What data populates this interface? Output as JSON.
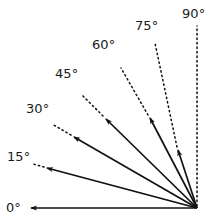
{
  "figure": {
    "background_color": "#ffffff",
    "line_color": "#111111",
    "label_color": "#1a1a1a",
    "vertex": {
      "x": 197,
      "y": 208
    },
    "degree_symbol": "°"
  },
  "rays": [
    {
      "id": "ray-0",
      "angle_deg": 0,
      "label": "0°",
      "label_x": 6,
      "label_y": 201,
      "solid_end": {
        "x": 31,
        "y": 208
      },
      "dotted_start": {
        "x": 31,
        "y": 208
      },
      "dotted_end": {
        "x": 31,
        "y": 208
      },
      "has_arrow": true,
      "fully_dotted": false
    },
    {
      "id": "ray-15",
      "angle_deg": 15,
      "label": "15°",
      "label_x": 7,
      "label_y": 150,
      "solid_end": {
        "x": 47,
        "y": 168
      },
      "dotted_start": {
        "x": 44,
        "y": 167
      },
      "dotted_end": {
        "x": 33,
        "y": 164
      },
      "has_arrow": true,
      "fully_dotted": false
    },
    {
      "id": "ray-30",
      "angle_deg": 30,
      "label": "30°",
      "label_x": 26,
      "label_y": 102,
      "solid_end": {
        "x": 74,
        "y": 137
      },
      "dotted_start": {
        "x": 71,
        "y": 135
      },
      "dotted_end": {
        "x": 52,
        "y": 124
      },
      "has_arrow": true,
      "fully_dotted": false
    },
    {
      "id": "ray-45",
      "angle_deg": 45,
      "label": "45°",
      "label_x": 55,
      "label_y": 67,
      "solid_end": {
        "x": 106,
        "y": 119
      },
      "dotted_start": {
        "x": 103,
        "y": 116
      },
      "dotted_end": {
        "x": 82,
        "y": 95
      },
      "has_arrow": true,
      "fully_dotted": false
    },
    {
      "id": "ray-60",
      "angle_deg": 60,
      "label": "60°",
      "label_x": 92,
      "label_y": 38,
      "solid_end": {
        "x": 150,
        "y": 118
      },
      "dotted_start": {
        "x": 148,
        "y": 115
      },
      "dotted_end": {
        "x": 121,
        "y": 68
      },
      "has_arrow": true,
      "fully_dotted": false
    },
    {
      "id": "ray-75",
      "angle_deg": 75,
      "label": "75°",
      "label_x": 135,
      "label_y": 19,
      "solid_end": {
        "x": 178,
        "y": 150
      },
      "dotted_start": {
        "x": 177,
        "y": 147
      },
      "dotted_end": {
        "x": 155,
        "y": 43
      },
      "has_arrow": true,
      "fully_dotted": false
    },
    {
      "id": "ray-90",
      "angle_deg": 90,
      "label": "90°",
      "label_x": 182,
      "label_y": 7,
      "solid_end": {
        "x": 197,
        "y": 208
      },
      "dotted_start": {
        "x": 197,
        "y": 206
      },
      "dotted_end": {
        "x": 197,
        "y": 26
      },
      "has_arrow": false,
      "fully_dotted": true
    }
  ]
}
